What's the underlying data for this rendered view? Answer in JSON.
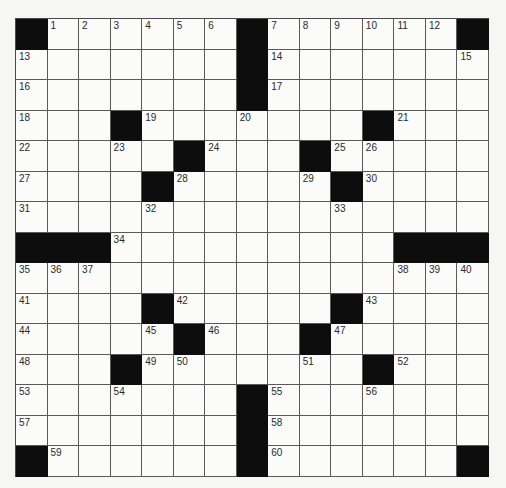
{
  "puzzle": {
    "type": "crossword",
    "rows": 15,
    "cols": 15,
    "colors": {
      "block": "#0d0d0d",
      "cell": "#fbfbfa",
      "line": "#5a5a5a",
      "number": "#2a2a2a"
    },
    "grid": [
      "#......#......#",
      ".......#.......",
      ".......#.......",
      "...#.......#...",
      ".....#...#.....",
      "....#.....#....",
      "...............",
      "###.........###",
      "...............",
      "....#.....#....",
      ".....#...#.....",
      "...#.......#...",
      ".......#.......",
      ".......#.......",
      "#......#......#"
    ],
    "numbers": [
      [
        0,
        1,
        "1"
      ],
      [
        0,
        2,
        "2"
      ],
      [
        0,
        3,
        "3"
      ],
      [
        0,
        4,
        "4"
      ],
      [
        0,
        5,
        "5"
      ],
      [
        0,
        6,
        "6"
      ],
      [
        0,
        8,
        "7"
      ],
      [
        0,
        9,
        "8"
      ],
      [
        0,
        10,
        "9"
      ],
      [
        0,
        11,
        "10"
      ],
      [
        0,
        12,
        "11"
      ],
      [
        0,
        13,
        "12"
      ],
      [
        1,
        0,
        "13"
      ],
      [
        1,
        8,
        "14"
      ],
      [
        1,
        14,
        "15"
      ],
      [
        2,
        0,
        "16"
      ],
      [
        2,
        8,
        "17"
      ],
      [
        3,
        0,
        "18"
      ],
      [
        3,
        4,
        "19"
      ],
      [
        3,
        7,
        "20"
      ],
      [
        3,
        12,
        "21"
      ],
      [
        4,
        0,
        "22"
      ],
      [
        4,
        3,
        "23"
      ],
      [
        4,
        6,
        "24"
      ],
      [
        4,
        10,
        "25"
      ],
      [
        4,
        11,
        "26"
      ],
      [
        5,
        0,
        "27"
      ],
      [
        5,
        5,
        "28"
      ],
      [
        5,
        9,
        "29"
      ],
      [
        5,
        11,
        "30"
      ],
      [
        6,
        0,
        "31"
      ],
      [
        6,
        4,
        "32"
      ],
      [
        6,
        10,
        "33"
      ],
      [
        7,
        3,
        "34"
      ],
      [
        8,
        0,
        "35"
      ],
      [
        8,
        1,
        "36"
      ],
      [
        8,
        2,
        "37"
      ],
      [
        8,
        12,
        "38"
      ],
      [
        8,
        13,
        "39"
      ],
      [
        8,
        14,
        "40"
      ],
      [
        9,
        0,
        "41"
      ],
      [
        9,
        5,
        "42"
      ],
      [
        9,
        11,
        "43"
      ],
      [
        10,
        0,
        "44"
      ],
      [
        10,
        4,
        "45"
      ],
      [
        10,
        6,
        "46"
      ],
      [
        10,
        10,
        "47"
      ],
      [
        11,
        0,
        "48"
      ],
      [
        11,
        4,
        "49"
      ],
      [
        11,
        5,
        "50"
      ],
      [
        11,
        9,
        "51"
      ],
      [
        11,
        12,
        "52"
      ],
      [
        12,
        0,
        "53"
      ],
      [
        12,
        3,
        "54"
      ],
      [
        12,
        8,
        "55"
      ],
      [
        12,
        11,
        "56"
      ],
      [
        13,
        0,
        "57"
      ],
      [
        13,
        8,
        "58"
      ],
      [
        14,
        1,
        "59"
      ],
      [
        14,
        8,
        "60"
      ]
    ]
  }
}
